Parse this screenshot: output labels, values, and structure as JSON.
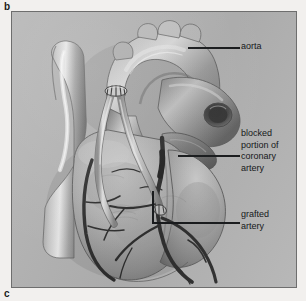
{
  "figure": {
    "panel_label_b": "b",
    "panel_label_c": "c",
    "plate_background_color": "#b4b4b4",
    "page_background_color": "#f2f0ee",
    "plate_border_color": "#6e6e6e",
    "leader_line_color": "#16181a",
    "label_text_color": "#16181a"
  },
  "labels": {
    "aorta": {
      "text": "aorta",
      "leader": {
        "type": "straight",
        "x1": 187,
        "y1": 47,
        "x2": 239,
        "y2": 47
      }
    },
    "blocked_artery": {
      "text": "blocked\nportion of\ncoronary\nartery",
      "lines": [
        "blocked",
        "portion of",
        "coronary",
        "artery"
      ],
      "leader": {
        "type": "straight",
        "x1": 177,
        "y1": 155,
        "x2": 239,
        "y2": 155
      }
    },
    "grafted_artery": {
      "text": "grafted\nartery",
      "lines": [
        "grafted",
        "artery"
      ],
      "leader": {
        "type": "elbow",
        "x1": 152,
        "y1": 190,
        "x2": 152,
        "y2": 222,
        "x3": 239,
        "y3": 222
      }
    }
  },
  "anatomy": {
    "structures": [
      {
        "name": "aorta",
        "note": "ascending aorta and aortic arch, upper centre of plate"
      },
      {
        "name": "aortic-arch-branches",
        "note": "brachiocephalic, left common carotid and left subclavian stumps along arch crown"
      },
      {
        "name": "superior-vena-cava",
        "note": "pale vessel at left of plate with bright specular highlight"
      },
      {
        "name": "pulmonary-artery",
        "note": "large vessel crossing to right with open lumen"
      },
      {
        "name": "right-ventricle",
        "note": "large anterior ventricular mass, lower centre"
      },
      {
        "name": "left-ventricle",
        "note": "ventricular mass to the lower right"
      },
      {
        "name": "coronary-artery",
        "note": "dark branching vessels over ventricular surface"
      },
      {
        "name": "blocked-segment",
        "note": "dark narrowed segment of coronary artery, mid plate"
      },
      {
        "name": "graft-vessel",
        "note": "two pale bypass conduits running from aorta down to coronary artery"
      },
      {
        "name": "anastomosis-proximal",
        "note": "suture site where grafts join the aorta, near top of grafts"
      },
      {
        "name": "anastomosis-distal",
        "note": "suture site where graft joins coronary artery below the blockage"
      }
    ]
  }
}
